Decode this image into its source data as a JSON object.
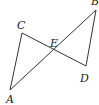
{
  "diagram": {
    "type": "geometry",
    "points": {
      "A": {
        "label": "A",
        "x": 10,
        "y": 90,
        "lx": 6,
        "ly": 103
      },
      "B": {
        "label": "B",
        "x": 96,
        "y": 10,
        "lx": 91,
        "ly": 4
      },
      "C": {
        "label": "C",
        "x": 22,
        "y": 33,
        "lx": 17,
        "ly": 29
      },
      "D": {
        "label": "D",
        "x": 86,
        "y": 66,
        "lx": 80,
        "ly": 81
      },
      "E": {
        "label": "E",
        "x": 54,
        "y": 51,
        "lx": 50,
        "ly": 46
      }
    },
    "segments": [
      [
        "A",
        "C"
      ],
      [
        "C",
        "D"
      ],
      [
        "A",
        "B"
      ],
      [
        "B",
        "D"
      ]
    ],
    "labels": [
      "A",
      "B",
      "C",
      "D",
      "E"
    ]
  }
}
